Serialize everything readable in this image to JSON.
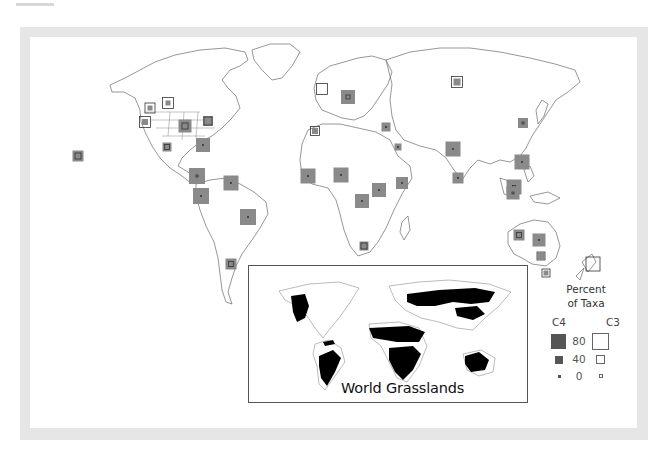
{
  "figure": {
    "type": "map",
    "colors": {
      "frame": "#e6e6e6",
      "c4_fill": "#8a8a8a",
      "c3_outline": "#333333",
      "grassland_fill": "#000000",
      "coastline": "#555555"
    }
  },
  "legend": {
    "title_line1": "Percent",
    "title_line2": "of Taxa",
    "c4_label": "C4",
    "c3_label": "C3",
    "levels": [
      {
        "value": "80"
      },
      {
        "value": "40"
      },
      {
        "value": "0"
      }
    ]
  },
  "inset": {
    "title": "World Grasslands"
  },
  "sites": [
    {
      "region": "Hawaii",
      "x": 78,
      "y": 156,
      "c4": 11,
      "c3": 6
    },
    {
      "region": "Alaska/Canada W",
      "x": 150,
      "y": 108,
      "c4": 5,
      "c3": 10
    },
    {
      "region": "Pacific NW",
      "x": 168,
      "y": 103,
      "c4": 5,
      "c3": 11
    },
    {
      "region": "California",
      "x": 145,
      "y": 122,
      "c4": 6,
      "c3": 11
    },
    {
      "region": "Great Plains",
      "x": 185,
      "y": 126,
      "c4": 13,
      "c3": 6
    },
    {
      "region": "NE USA",
      "x": 208,
      "y": 121,
      "c4": 10,
      "c3": 8
    },
    {
      "region": "Mexico",
      "x": 167,
      "y": 147,
      "c4": 9,
      "c3": 5
    },
    {
      "region": "Caribbean",
      "x": 203,
      "y": 145,
      "c4": 14,
      "c3": 1
    },
    {
      "region": "Central America",
      "x": 197,
      "y": 176,
      "c4": 16,
      "c3": 2
    },
    {
      "region": "Colombia/Ecuador",
      "x": 201,
      "y": 196,
      "c4": 16,
      "c3": 0
    },
    {
      "region": "Venezuela/Guianas",
      "x": 231,
      "y": 183,
      "c4": 15,
      "c3": 1
    },
    {
      "region": "Brazil",
      "x": 248,
      "y": 217,
      "c4": 16,
      "c3": 0
    },
    {
      "region": "Argentina",
      "x": 231,
      "y": 264,
      "c4": 11,
      "c3": 5
    },
    {
      "region": "British Isles",
      "x": 322,
      "y": 89,
      "c4": 0,
      "c3": 11
    },
    {
      "region": "Central Europe",
      "x": 348,
      "y": 97,
      "c4": 14,
      "c3": 4
    },
    {
      "region": "Iberia/Morocco",
      "x": 315,
      "y": 131,
      "c4": 6,
      "c3": 9
    },
    {
      "region": "Middle East",
      "x": 386,
      "y": 127,
      "c4": 9,
      "c3": 0
    },
    {
      "region": "Arabia",
      "x": 398,
      "y": 147,
      "c4": 7,
      "c3": 0
    },
    {
      "region": "West Africa",
      "x": 308,
      "y": 176,
      "c4": 15,
      "c3": 0
    },
    {
      "region": "Central West Africa",
      "x": 341,
      "y": 175,
      "c4": 15,
      "c3": 1
    },
    {
      "region": "East Africa",
      "x": 379,
      "y": 190,
      "c4": 14,
      "c3": 1
    },
    {
      "region": "Horn of Africa",
      "x": 402,
      "y": 183,
      "c4": 12,
      "c3": 1
    },
    {
      "region": "Southern Central Africa",
      "x": 362,
      "y": 201,
      "c4": 14,
      "c3": 1
    },
    {
      "region": "South Africa",
      "x": 364,
      "y": 246,
      "c4": 9,
      "c3": 6
    },
    {
      "region": "Siberia",
      "x": 457,
      "y": 82,
      "c4": 7,
      "c3": 11
    },
    {
      "region": "Korea/Japan",
      "x": 523,
      "y": 123,
      "c4": 10,
      "c3": 2
    },
    {
      "region": "North India",
      "x": 453,
      "y": 149,
      "c4": 15,
      "c3": 1
    },
    {
      "region": "South India",
      "x": 458,
      "y": 178,
      "c4": 11,
      "c3": 1
    },
    {
      "region": "Philippines/SE China",
      "x": 522,
      "y": 162,
      "c4": 15,
      "c3": 1
    },
    {
      "region": "Indonesia/Malaysia",
      "x": 514,
      "y": 187,
      "c4": 15,
      "c3": 3
    },
    {
      "region": "Borneo",
      "x": 513,
      "y": 193,
      "c4": 13,
      "c3": 2
    },
    {
      "region": "West Australia",
      "x": 519,
      "y": 235,
      "c4": 11,
      "c3": 5
    },
    {
      "region": "Central Australia",
      "x": 539,
      "y": 240,
      "c4": 13,
      "c3": 1
    },
    {
      "region": "SE Australia",
      "x": 541,
      "y": 256,
      "c4": 7,
      "c3": 8
    },
    {
      "region": "Tasmania",
      "x": 546,
      "y": 273,
      "c4": 5,
      "c3": 8
    },
    {
      "region": "New Zealand",
      "x": 593,
      "y": 264,
      "c4": 0,
      "c3": 14
    }
  ]
}
